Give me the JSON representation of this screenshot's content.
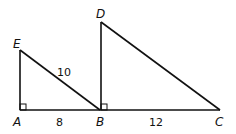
{
  "diagram": {
    "type": "geometry",
    "points": {
      "A": {
        "label": "A",
        "x": 20,
        "y": 110
      },
      "E": {
        "label": "E",
        "x": 20,
        "y": 50
      },
      "B": {
        "label": "B",
        "x": 100,
        "y": 110
      },
      "D": {
        "label": "D",
        "x": 101,
        "y": 22
      },
      "C": {
        "label": "C",
        "x": 220,
        "y": 110
      }
    },
    "segments": [
      "AE",
      "EB",
      "AB",
      "BD",
      "DC",
      "BC"
    ],
    "right_angles": [
      "A",
      "B"
    ],
    "measures": {
      "EB": "10",
      "AB": "8",
      "BC": "12"
    }
  }
}
